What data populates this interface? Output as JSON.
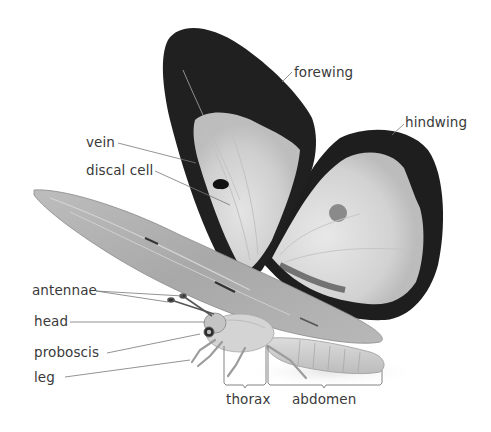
{
  "diagram": {
    "labels": {
      "forewing": "forewing",
      "hindwing": "hindwing",
      "vein": "vein",
      "discal_cell": "discal cell",
      "antennae": "antennae",
      "head": "head",
      "proboscis": "proboscis",
      "leg": "leg",
      "thorax": "thorax",
      "abdomen": "abdomen"
    },
    "colors": {
      "label_text": "#3a3a3a",
      "leader_line": "#777777",
      "wing_border": "#1e1e1e",
      "wing_fill": "#d8d8d8",
      "body": "#c8c8c8"
    }
  }
}
